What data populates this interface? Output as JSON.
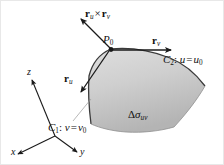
{
  "figure": {
    "background_color": "#ffffff",
    "ink_color": "#1a1a1a",
    "surface_fill_top": "#d9d9d9",
    "surface_fill_bottom": "#b8b8b8",
    "surface_edge_color": "#4a4a4a"
  },
  "labels": {
    "normal_vector": {
      "r_bold": "r",
      "sub_u": "u",
      "times": "×",
      "r_bold2": "r",
      "sub_v": "v"
    },
    "point": {
      "name": "P",
      "sub": "0"
    },
    "tangent_v": {
      "r_bold": "r",
      "sub": "v"
    },
    "tangent_u": {
      "r_bold": "r",
      "sub": "u"
    },
    "curve_c2": {
      "curve": "C",
      "curve_sub": "2",
      "colon": ":",
      "param": "u",
      "equals": "=",
      "value": "u",
      "value_sub": "0"
    },
    "curve_c1": {
      "curve": "C",
      "curve_sub": "1",
      "colon": ":",
      "param": "v",
      "equals": "=",
      "value": "v",
      "value_sub": "0"
    },
    "area_element": {
      "delta": "Δ",
      "sigma": "σ",
      "sub": "uv"
    },
    "axes": {
      "z": "z",
      "x": "x",
      "y": "y"
    }
  },
  "geometry": {
    "axes_origin": [
      55,
      136
    ],
    "z_axis_tip": [
      32,
      78
    ],
    "x_axis_tip": [
      16,
      155
    ],
    "y_axis_tip": [
      78,
      153
    ],
    "point_p0": [
      111,
      49
    ],
    "normal_arrow_tip": [
      80,
      18
    ],
    "tangent_v_arrow_tip": [
      172,
      50
    ],
    "tangent_u_arrow_tip": [
      80,
      93
    ],
    "leader_c1_from": [
      72,
      122
    ],
    "leader_c1_to": [
      92,
      98
    ]
  }
}
